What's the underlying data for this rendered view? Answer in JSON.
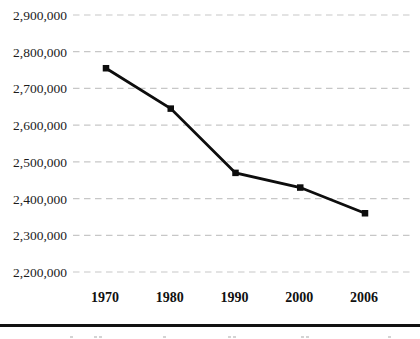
{
  "chart_data": {
    "type": "line",
    "title": "",
    "xlabel": "",
    "ylabel": "",
    "categories": [
      "1970",
      "1980",
      "1990",
      "2000",
      "2006"
    ],
    "values": [
      2755000,
      2645000,
      2470000,
      2430000,
      2360000
    ],
    "series": [
      {
        "name": "value",
        "values": [
          2755000,
          2645000,
          2470000,
          2430000,
          2360000
        ]
      }
    ],
    "ylim": [
      2200000,
      2900000
    ],
    "ytick_step": 100000,
    "ytick_labels": [
      "2,900,000",
      "2,800,000",
      "2,700,000",
      "2,600,000",
      "2,500,000",
      "2,400,000",
      "2,300,000",
      "2,200,000"
    ],
    "xtick_labels": [
      "1970",
      "1980",
      "1990",
      "2000",
      "2006"
    ],
    "grid": "horizontal-dashed",
    "legend": "none",
    "marker": "filled-square",
    "colors": {
      "background": "#ffffff",
      "line": "#0d0d0d",
      "marker": "#0d0d0d",
      "gridline": "#c7c7c7",
      "ytick_text": "#1c1c1c",
      "xtick_text": "#111111",
      "divider": "#111111"
    }
  }
}
